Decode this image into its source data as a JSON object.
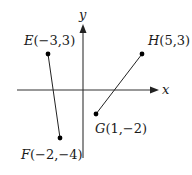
{
  "diagram": {
    "type": "coordinate-plane",
    "axes": {
      "x_label": "x",
      "y_label": "y"
    },
    "points": [
      {
        "name": "E",
        "coords": "(−3,3)",
        "x": -3,
        "y": 3
      },
      {
        "name": "F",
        "coords": "(−2,−4)",
        "x": -2,
        "y": -4
      },
      {
        "name": "G",
        "coords": "(1,−2)",
        "x": 1,
        "y": -2
      },
      {
        "name": "H",
        "coords": "(5,3)",
        "x": 5,
        "y": 3
      }
    ],
    "segments": [
      {
        "from": "E",
        "to": "F"
      },
      {
        "from": "G",
        "to": "H"
      }
    ],
    "colors": {
      "axis": "#333333",
      "line": "#222222",
      "point": "#000000",
      "text": "#1a1a1a"
    }
  }
}
